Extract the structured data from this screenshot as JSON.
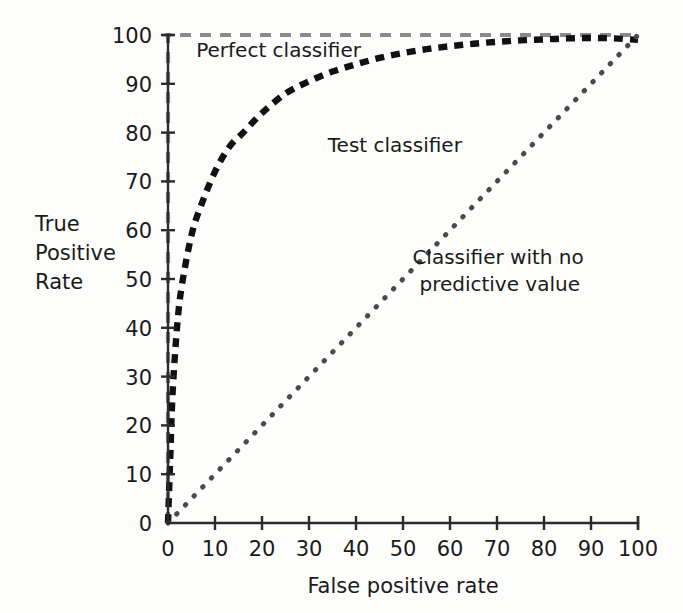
{
  "chart_data": {
    "type": "line",
    "title": "",
    "xlabel": "False positive rate",
    "ylabel": "True Positive Rate",
    "ylabel_lines": [
      "True",
      "Positive",
      "Rate"
    ],
    "xlim": [
      0,
      100
    ],
    "ylim": [
      0,
      100
    ],
    "grid": false,
    "legend_position": "inline-annotations",
    "x_ticks": [
      "0",
      "10",
      "20",
      "30",
      "40",
      "50",
      "60",
      "70",
      "80",
      "90",
      "100"
    ],
    "x_tick_values": [
      0,
      10,
      20,
      30,
      40,
      50,
      60,
      70,
      80,
      90,
      100
    ],
    "y_ticks": [
      "0",
      "10",
      "20",
      "30",
      "40",
      "50",
      "60",
      "70",
      "80",
      "90",
      "100"
    ],
    "y_tick_values": [
      0,
      10,
      20,
      30,
      40,
      50,
      60,
      70,
      80,
      90,
      100
    ],
    "series": [
      {
        "name": "Perfect classifier",
        "style": "dashed",
        "color": "#8a8a8a",
        "x": [
          0,
          0,
          0,
          5,
          10,
          20,
          30,
          40,
          50,
          60,
          70,
          80,
          90,
          100
        ],
        "values": [
          0,
          50,
          100,
          100,
          100,
          100,
          100,
          100,
          100,
          100,
          100,
          100,
          100,
          100
        ]
      },
      {
        "name": "Test classifier",
        "style": "dashed-bold",
        "color": "#111111",
        "x": [
          0,
          0.5,
          1,
          2,
          3,
          5,
          7,
          10,
          13,
          16,
          20,
          25,
          30,
          35,
          40,
          45,
          50,
          55,
          60,
          65,
          70,
          75,
          80,
          85,
          90,
          95,
          100
        ],
        "values": [
          0,
          14,
          27,
          41,
          49,
          59,
          65,
          72,
          77,
          80,
          84,
          88,
          90.5,
          92.5,
          94,
          95.3,
          96.3,
          97.1,
          97.7,
          98.2,
          98.6,
          98.9,
          99.1,
          99.3,
          99.4,
          99.3,
          99
        ]
      },
      {
        "name": "Classifier with no predictive value",
        "style": "dotted",
        "color": "#4a4a4a",
        "x": [
          0,
          10,
          20,
          30,
          40,
          50,
          60,
          70,
          80,
          90,
          100
        ],
        "values": [
          0,
          10,
          20,
          30,
          40,
          50,
          60,
          70,
          80,
          90,
          100
        ]
      }
    ],
    "annotations": [
      {
        "text": "Perfect classifier",
        "x": 6,
        "y": 95.5
      },
      {
        "text": "Test classifier",
        "x": 34,
        "y": 76
      },
      {
        "text": "Classifier with no",
        "x": 52,
        "y": 53
      },
      {
        "text": "predictive value",
        "x": 53.5,
        "y": 47.5
      }
    ]
  },
  "labels": {
    "x_axis_title": "False positive rate",
    "y_axis_title_line1": "True",
    "y_axis_title_line2": "Positive",
    "y_axis_title_line3": "Rate",
    "annotation_perfect": "Perfect classifier",
    "annotation_test": "Test classifier",
    "annotation_nopred_line1": "Classifier with no",
    "annotation_nopred_line2": "predictive value"
  },
  "colors": {
    "background": "#fdfdfc",
    "axis": "#2b2b2b",
    "perfect_classifier": "#8a8a8a",
    "test_classifier": "#111111",
    "no_predictive_value": "#4a4a4a",
    "text": "#1a1a1a"
  }
}
